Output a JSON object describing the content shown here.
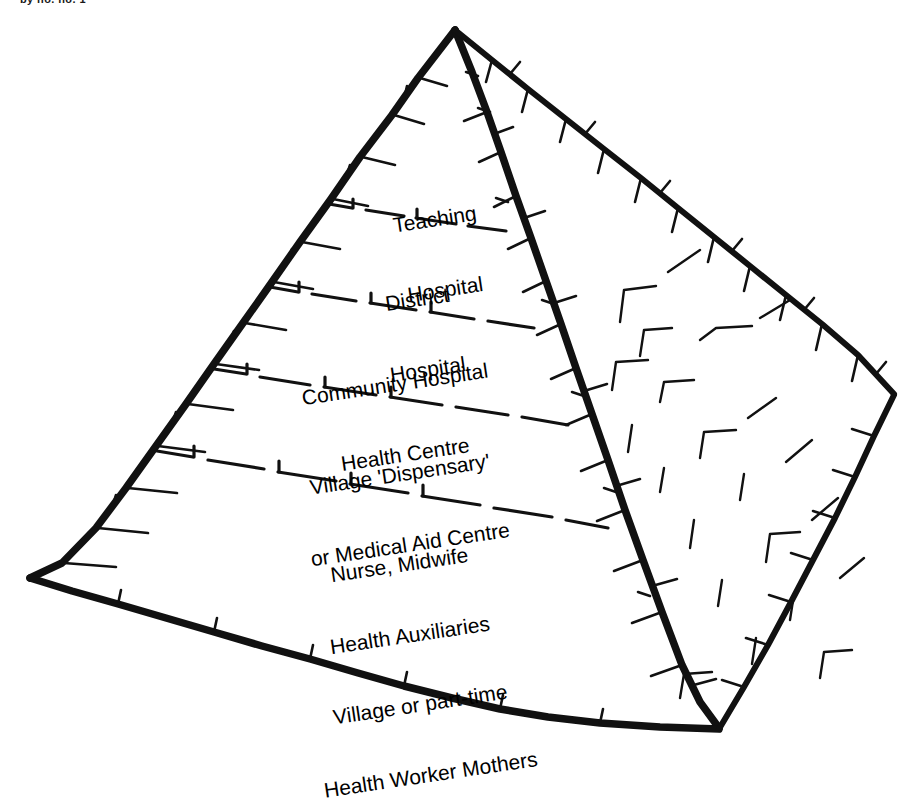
{
  "page": {
    "background_color": "#ffffff",
    "ink_color": "#111111",
    "width": 919,
    "height": 747
  },
  "caption": {
    "fragment_text": "by no. no. 1"
  },
  "diagram": {
    "kind": "pyramid",
    "style": "hand-drawn ink sketch, 3D pyramid, tick-marked edges, dashed tier dividers",
    "text_rotation_degrees": -8.5,
    "geometry": {
      "apex": [
        455,
        28
      ],
      "left_corner": [
        28,
        578
      ],
      "front_corner": [
        720,
        728
      ],
      "right_corner": [
        895,
        395
      ]
    },
    "tiers": [
      {
        "index": 1,
        "name": "teaching-hospital",
        "lines": [
          "Teaching",
          "Hospital"
        ],
        "label_left": 340,
        "label_top": 160,
        "label_width": 200,
        "font_size": 21
      },
      {
        "index": 2,
        "name": "district-hospital",
        "lines": [
          "District",
          "Hospital"
        ],
        "label_left": 315,
        "label_top": 240,
        "label_width": 215,
        "font_size": 21
      },
      {
        "index": 3,
        "name": "community-hospital-health-centre",
        "lines": [
          "Community Hospital",
          "Health Centre"
        ],
        "label_left": 250,
        "label_top": 325,
        "label_width": 300,
        "font_size": 21
      },
      {
        "index": 4,
        "name": "village-dispensary-medical-aid-centre",
        "lines": [
          "Village 'Dispensary'",
          "or Medical Aid Centre"
        ],
        "label_left": 250,
        "label_top": 415,
        "label_width": 310,
        "font_size": 21
      },
      {
        "index": 5,
        "name": "community-health-workers",
        "lines": [
          "Nurse, Midwife",
          "Health Auxiliaries",
          "Village or part-time",
          "Health Worker Mothers"
        ],
        "label_left": 250,
        "label_top": 505,
        "label_width": 330,
        "font_size": 21
      }
    ]
  }
}
